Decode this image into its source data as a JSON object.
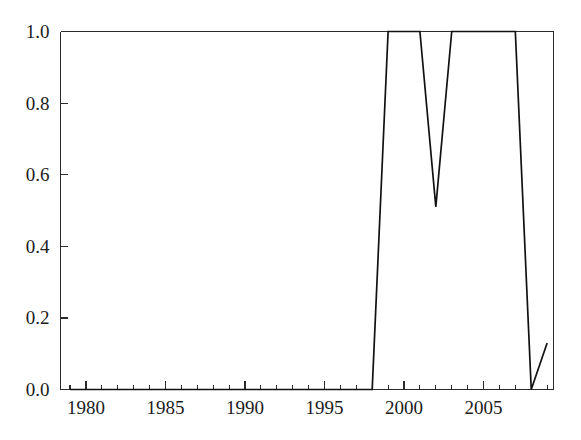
{
  "figure": {
    "background_color": "#ffffff",
    "line_color": "#111111",
    "axis_color": "#2b2b2b",
    "text_color": "#1c1c1c"
  },
  "chart_data": {
    "type": "line",
    "title": "",
    "subtitle": "",
    "xlabel": "",
    "ylabel": "",
    "xlim": [
      1978.4,
      2009.4
    ],
    "ylim": [
      0.0,
      1.0
    ],
    "grid": false,
    "legend": null,
    "legend_position": "none",
    "annotations": [],
    "x_tick_labels": [
      "1980",
      "1985",
      "1990",
      "1995",
      "2000",
      "2005"
    ],
    "x_tick_values": [
      1980,
      1985,
      1990,
      1995,
      2000,
      2005
    ],
    "x_minor_tick_interval": 1,
    "y_tick_labels": [
      "0.0",
      "0.2",
      "0.4",
      "0.6",
      "0.8",
      "1.0"
    ],
    "y_tick_values": [
      0.0,
      0.2,
      0.4,
      0.6,
      0.8,
      1.0
    ],
    "series": [
      {
        "name": "proportion",
        "x": [
          1979,
          1980,
          1981,
          1982,
          1983,
          1984,
          1985,
          1986,
          1987,
          1988,
          1989,
          1990,
          1991,
          1992,
          1993,
          1994,
          1995,
          1996,
          1997,
          1998,
          1999,
          2000,
          2001,
          2002,
          2003,
          2004,
          2005,
          2006,
          2007,
          2008,
          2009
        ],
        "values": [
          0.0,
          0.0,
          0.0,
          0.0,
          0.0,
          0.0,
          0.0,
          0.0,
          0.0,
          0.0,
          0.0,
          0.0,
          0.0,
          0.0,
          0.0,
          0.0,
          0.0,
          0.0,
          0.0,
          0.0,
          1.0,
          1.0,
          1.0,
          0.51,
          1.0,
          1.0,
          1.0,
          1.0,
          1.0,
          0.0,
          0.13
        ]
      }
    ]
  }
}
